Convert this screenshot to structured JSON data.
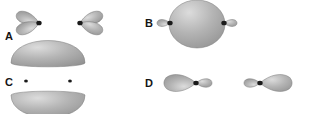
{
  "figure": {
    "type": "molecular-orbital-diagram-set",
    "background_color": "#ffffff",
    "width": 310,
    "height": 114,
    "lobe_fill_highlight": "#dcdcdc",
    "lobe_fill_mid": "#b4b4b4",
    "lobe_fill_edge": "#8c8c8c",
    "lobe_outline_color": "#7a7a7a",
    "nucleus_color": "#1a1a1a",
    "label_color": "#141414"
  },
  "panels": [
    {
      "id": "A",
      "label": "A",
      "label_x": 5,
      "label_y": 31,
      "description": "two facing p-orbital lobe pairs, each with two teardrop lobes meeting at a nucleus",
      "orbitals": [
        {
          "name": "left-p-orbital-pair",
          "nucleus_x": 39,
          "nucleus_y": 23,
          "lobes": [
            {
              "name": "upper-left-lobe",
              "angle": 201,
              "length": 24,
              "width": 15
            },
            {
              "name": "lower-left-lobe",
              "angle": 159,
              "length": 24,
              "width": 15
            }
          ]
        },
        {
          "name": "right-p-orbital-pair",
          "nucleus_x": 80,
          "nucleus_y": 23,
          "lobes": [
            {
              "name": "upper-right-lobe",
              "angle": -21,
              "length": 24,
              "width": 15
            },
            {
              "name": "lower-right-lobe",
              "angle": 21,
              "length": 24,
              "width": 15
            }
          ]
        }
      ]
    },
    {
      "id": "B",
      "label": "B",
      "label_x": 145,
      "label_y": 18,
      "description": "large central sphere flanked by two small lobes joined at nuclei",
      "sphere": {
        "name": "central-sphere",
        "cx": 197,
        "cy": 24,
        "rx": 28,
        "ry": 24
      },
      "orbitals": [
        {
          "name": "left-small-lobe-group",
          "nucleus_x": 170,
          "nucleus_y": 23,
          "lobes": [
            {
              "name": "left-small-lobe",
              "angle": 180,
              "length": 13,
              "width": 9
            }
          ]
        },
        {
          "name": "right-small-lobe-group",
          "nucleus_x": 224,
          "nucleus_y": 23,
          "lobes": [
            {
              "name": "right-small-lobe",
              "angle": 0,
              "length": 13,
              "width": 9
            }
          ]
        }
      ]
    },
    {
      "id": "C",
      "label": "C",
      "label_x": 5,
      "label_y": 77,
      "description": "two flattened domes stacked vertically with flat faces toward center, two nuclei in the gap",
      "domes": [
        {
          "name": "upper-dome",
          "cx": 48,
          "cy": 63,
          "rx": 37,
          "ry": 15
        },
        {
          "name": "lower-dome",
          "cx": 48,
          "cy": 95,
          "rx": 37,
          "ry": 15
        }
      ],
      "nuclei": [
        {
          "name": "left-nucleus",
          "x": 26,
          "y": 81
        },
        {
          "name": "right-nucleus",
          "x": 70,
          "y": 81
        }
      ]
    },
    {
      "id": "D",
      "label": "D",
      "label_x": 145,
      "label_y": 78,
      "description": "two mirrored orbitals each with a large outward lobe and a small inward lobe separated by a nucleus",
      "orbitals": [
        {
          "name": "left-orbital",
          "nucleus_x": 196,
          "nucleus_y": 83,
          "lobes": [
            {
              "name": "left-large-lobe",
              "angle": 180,
              "length": 32,
              "width": 22
            },
            {
              "name": "left-small-lobe",
              "angle": 0,
              "length": 16,
              "width": 11
            }
          ]
        },
        {
          "name": "right-orbital",
          "nucleus_x": 260,
          "nucleus_y": 83,
          "lobes": [
            {
              "name": "right-large-lobe",
              "angle": 0,
              "length": 32,
              "width": 22
            },
            {
              "name": "right-small-lobe",
              "angle": 180,
              "length": 16,
              "width": 11
            }
          ]
        }
      ]
    }
  ]
}
